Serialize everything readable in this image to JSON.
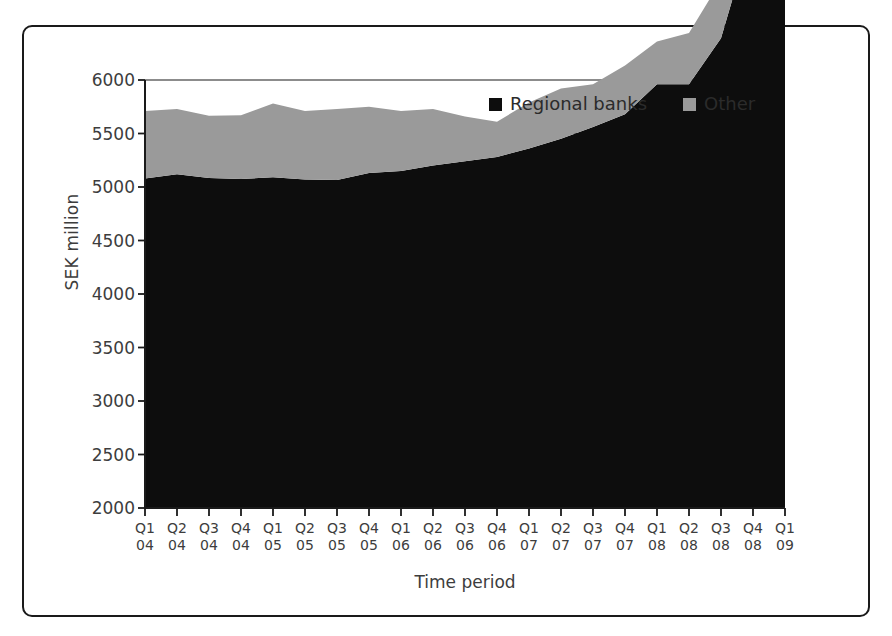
{
  "figure": {
    "border_color": "#1a1a1a",
    "background": "#ffffff"
  },
  "chart_data": {
    "type": "area",
    "stacked": true,
    "title": "",
    "subtitle": "",
    "xlabel": "Time period",
    "ylabel": "SEK million",
    "ylim": [
      2000,
      6000
    ],
    "ytick_step": 500,
    "grid": true,
    "grid_axis": "y",
    "legend_position": "top-right",
    "categories": [
      "Q1 04",
      "Q2 04",
      "Q3 04",
      "Q4 04",
      "Q1 05",
      "Q2 05",
      "Q3 05",
      "Q4 05",
      "Q1 06",
      "Q2 06",
      "Q3 06",
      "Q4 06",
      "Q1 07",
      "Q2 07",
      "Q3 07",
      "Q4 07",
      "Q1 08",
      "Q2 08",
      "Q3 08",
      "Q4 08",
      "Q1 09"
    ],
    "x_tick_quarters": [
      "Q1",
      "Q2",
      "Q3",
      "Q4",
      "Q1",
      "Q2",
      "Q3",
      "Q4",
      "Q1",
      "Q2",
      "Q3",
      "Q4",
      "Q1",
      "Q2",
      "Q3",
      "Q4",
      "Q1",
      "Q2",
      "Q3",
      "Q4",
      "Q1"
    ],
    "x_tick_years": [
      "04",
      "04",
      "04",
      "04",
      "05",
      "05",
      "05",
      "05",
      "06",
      "06",
      "06",
      "06",
      "07",
      "07",
      "07",
      "07",
      "08",
      "08",
      "08",
      "08",
      "09"
    ],
    "y_tick_labels": [
      "2000",
      "2500",
      "3000",
      "3500",
      "4000",
      "4500",
      "5000",
      "5500",
      "6000"
    ],
    "y_tick_values": [
      2000,
      2500,
      3000,
      3500,
      4000,
      4500,
      5000,
      5500,
      6000
    ],
    "series": [
      {
        "name": "Regional banks",
        "color": "#0d0d0d",
        "values": [
          3080,
          3120,
          3085,
          3075,
          3090,
          3070,
          3065,
          3130,
          3150,
          3200,
          3240,
          3280,
          3360,
          3450,
          3560,
          3680,
          3960,
          3960,
          4390,
          5410,
          5110
        ]
      },
      {
        "name": "Other",
        "color": "#9a9a9a",
        "values": [
          630,
          610,
          580,
          595,
          690,
          640,
          665,
          620,
          560,
          530,
          420,
          330,
          430,
          470,
          400,
          455,
          400,
          480,
          540,
          0,
          220
        ]
      }
    ],
    "series_totals": {
      "name": "Total (stacked top)",
      "values": [
        3710,
        3730,
        3665,
        3670,
        3780,
        3710,
        3730,
        3750,
        3710,
        3730,
        3660,
        3610,
        3790,
        3920,
        3960,
        4135,
        4360,
        4440,
        4930,
        5410,
        5330
      ]
    },
    "legend": [
      {
        "label": "Regional banks",
        "swatch": "#0d0d0d",
        "marker": "square-marker"
      },
      {
        "label": "Other",
        "swatch": "#9a9a9a",
        "marker": "square-marker"
      }
    ]
  }
}
